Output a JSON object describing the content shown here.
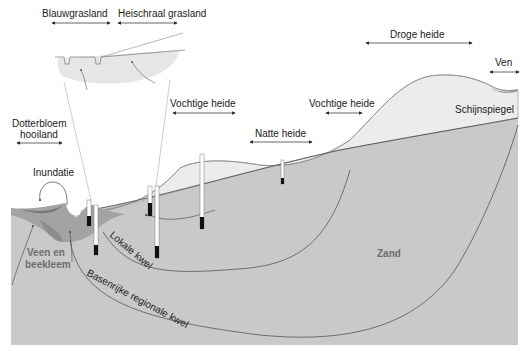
{
  "habitats": [
    {
      "id": "blauwgrasland",
      "label": "Blauwgrasland"
    },
    {
      "id": "heischraal",
      "label": "Heischraal grasland"
    },
    {
      "id": "droge_heide",
      "label": "Droge heide"
    },
    {
      "id": "ven",
      "label": "Ven"
    },
    {
      "id": "dotterbloem",
      "label_line1": "Dotterbloem",
      "label_line2": "hooiland"
    },
    {
      "id": "vochtige_heide_1",
      "label": "Vochtige heide"
    },
    {
      "id": "vochtige_heide_2",
      "label": "Vochtige heide"
    },
    {
      "id": "natte_heide",
      "label": "Natte heide"
    }
  ],
  "features": {
    "schijnspiegel": "Schijnspiegel",
    "inundatie": "Inundatie",
    "veen_line1": "Veen en",
    "veen_line2": "beekleem",
    "zand": "Zand",
    "lokale_kwel": "Lokale kwel",
    "regionale_kwel": "Basenrijke regionale kwel"
  },
  "colors": {
    "sand": "#c9c9c9",
    "upper_layer": "#ebebeb",
    "peat": "#8f8f8f",
    "peat_light": "#a9a9a9",
    "line": "#5a5a5a",
    "text": "#1a1a1a",
    "text_grey": "#6e6e6e"
  }
}
